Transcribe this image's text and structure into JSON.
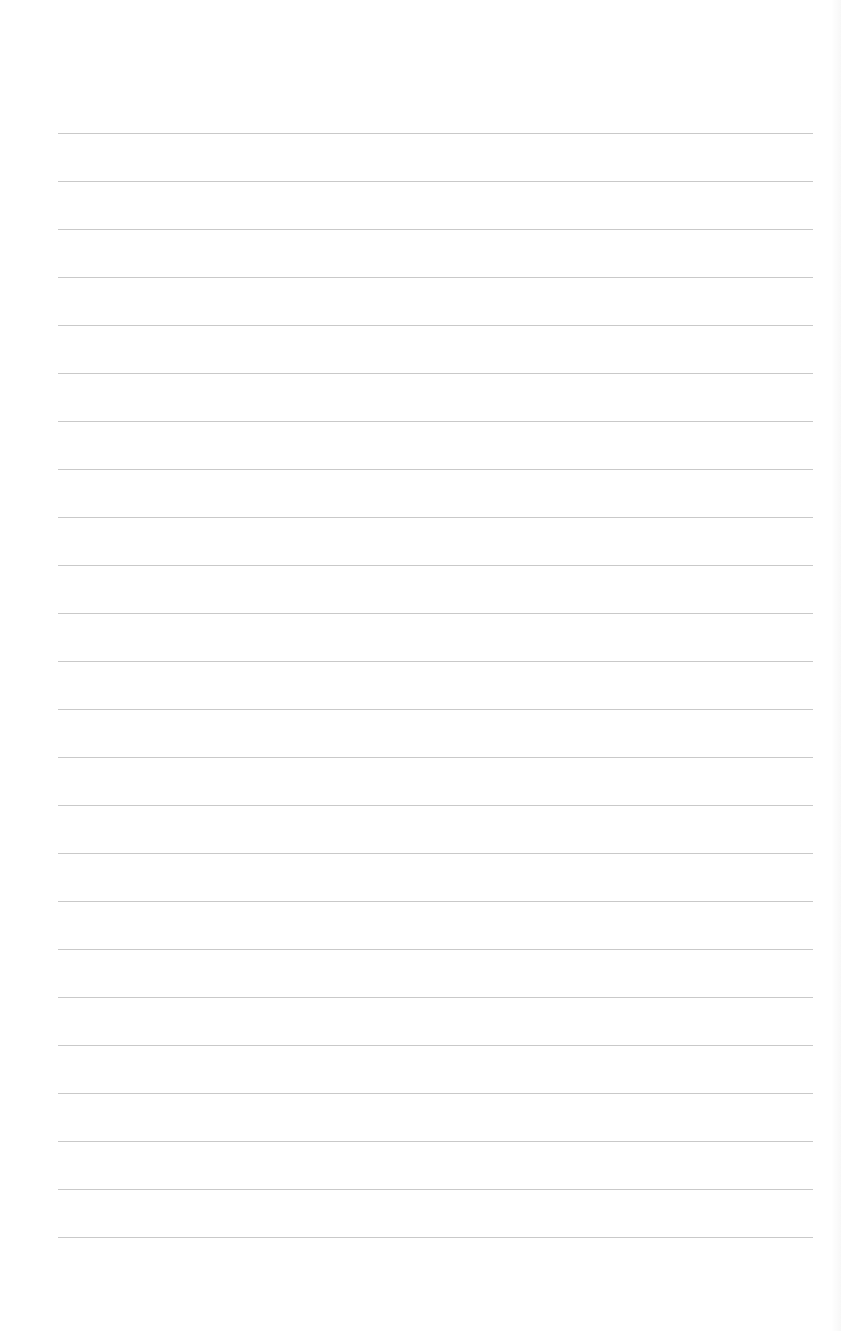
{
  "page": {
    "type": "lined-paper",
    "background_color": "#ffffff",
    "line_color": "#c9c9c9",
    "line_count": 24,
    "first_line_y": 133,
    "line_spacing": 48,
    "line_left": 58,
    "line_width": 755
  }
}
